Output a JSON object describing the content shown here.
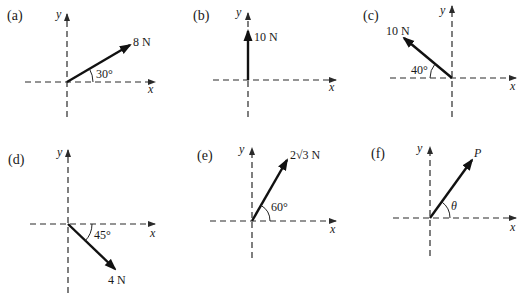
{
  "figure": {
    "panels": [
      {
        "id": "a",
        "label": "(a)",
        "force_label": "8 N",
        "angle_label": "30°",
        "x_axis": "x",
        "y_axis": "y",
        "magnitude": "8 N",
        "angle_deg": 30,
        "direction": "above +x axis"
      },
      {
        "id": "b",
        "label": "(b)",
        "force_label": "10 N",
        "angle_label": "",
        "x_axis": "x",
        "y_axis": "y",
        "magnitude": "10 N",
        "angle_deg": 90,
        "direction": "along +y axis"
      },
      {
        "id": "c",
        "label": "(c)",
        "force_label": "10 N",
        "angle_label": "40°",
        "x_axis": "x",
        "y_axis": "y",
        "magnitude": "10 N",
        "angle_deg": 40,
        "direction": "above -x axis"
      },
      {
        "id": "d",
        "label": "(d)",
        "force_label": "4 N",
        "angle_label": "45°",
        "x_axis": "x",
        "y_axis": "y",
        "magnitude": "4 N",
        "angle_deg": 45,
        "direction": "below +x axis"
      },
      {
        "id": "e",
        "label": "(e)",
        "force_label": "2√3 N",
        "angle_label": "60°",
        "x_axis": "x",
        "y_axis": "y",
        "magnitude": "2√3 N",
        "angle_deg": 60,
        "direction": "above +x axis"
      },
      {
        "id": "f",
        "label": "(f)",
        "force_label": "P",
        "angle_label": "θ",
        "x_axis": "x",
        "y_axis": "y",
        "magnitude": "P",
        "angle_deg": "θ",
        "direction": "above +x axis"
      }
    ]
  },
  "colors": {
    "ink": "#111111",
    "background": "#ffffff"
  }
}
